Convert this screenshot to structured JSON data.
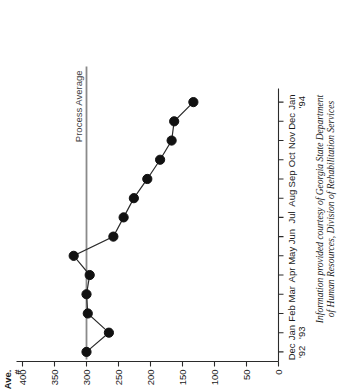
{
  "figure": {
    "orientation": "rotated-90-ccw",
    "background_color": "#ffffff",
    "marker_color": "#111111",
    "line_color": "#2b2b2b",
    "average_line_color": "#8a8a8a"
  },
  "annotations": {
    "process_average_label": "Process Average",
    "value_axis_name_line1": "Ave.",
    "value_axis_name_line2": "#"
  },
  "caption": {
    "line1": "Information provided courtesy of Georgia State Department",
    "line2": "of Human Resources, Division of Rehabilitation Services"
  },
  "chart_data": {
    "type": "line",
    "title": "",
    "xlabel": "",
    "ylabel": "Ave. #",
    "categories": [
      "Dec '92",
      "Jan '93",
      "Feb",
      "Mar",
      "Apr",
      "May",
      "Jun",
      "Jul",
      "Aug",
      "Sep",
      "Oct",
      "Nov",
      "Dec",
      "Jan '94"
    ],
    "category_labels": [
      {
        "main": "Dec",
        "sub": "'92"
      },
      {
        "main": "Jan",
        "sub": "'93"
      },
      {
        "main": "Feb",
        "sub": ""
      },
      {
        "main": "Mar",
        "sub": ""
      },
      {
        "main": "Apr",
        "sub": ""
      },
      {
        "main": "May",
        "sub": ""
      },
      {
        "main": "Jun",
        "sub": ""
      },
      {
        "main": "Jul",
        "sub": ""
      },
      {
        "main": "Aug",
        "sub": ""
      },
      {
        "main": "Sep",
        "sub": ""
      },
      {
        "main": "Oct",
        "sub": ""
      },
      {
        "main": "Nov",
        "sub": ""
      },
      {
        "main": "Dec",
        "sub": ""
      },
      {
        "main": "Jan",
        "sub": "'94"
      }
    ],
    "values": [
      300,
      265,
      298,
      300,
      295,
      320,
      258,
      242,
      226,
      205,
      185,
      167,
      163,
      133
    ],
    "process_average": 300,
    "ylim": [
      0,
      400
    ],
    "yticks": [
      0,
      50,
      100,
      150,
      200,
      250,
      300,
      350,
      400
    ],
    "ytick_labels": [
      "0",
      "50",
      "100",
      "150",
      "200",
      "250",
      "300",
      "350",
      "400"
    ],
    "grid": false,
    "legend": "none",
    "series": [
      {
        "name": "Ave. #",
        "values": [
          300,
          265,
          298,
          300,
          295,
          320,
          258,
          242,
          226,
          205,
          185,
          167,
          163,
          133
        ]
      }
    ]
  }
}
